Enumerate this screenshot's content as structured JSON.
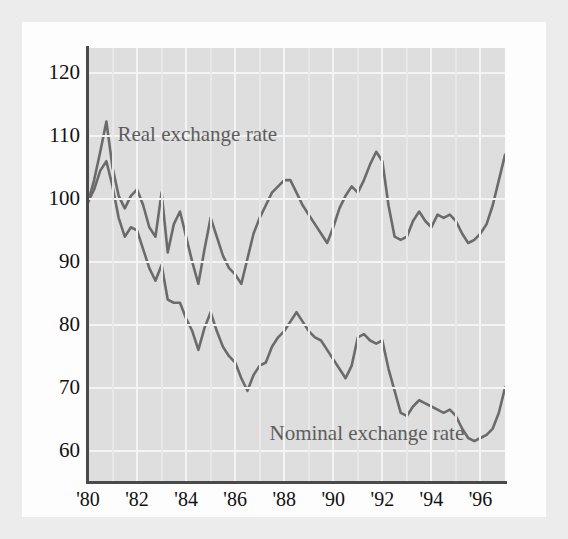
{
  "figure": {
    "background": "#fdfdfd",
    "plot_background": "#dedede",
    "axis_color": "#4a4a4a",
    "gridline_color": "#f4f4f4",
    "line_color": "#6b6b6b"
  },
  "chart_data": {
    "type": "line",
    "title": "",
    "subtitle": "",
    "xlabel": "",
    "ylabel": "",
    "xlim": [
      1980,
      1997
    ],
    "ylim": [
      55,
      124
    ],
    "grid": true,
    "legend_position": "inline-annotations",
    "ytick_labels": [
      "120",
      "110",
      "100",
      "90",
      "80",
      "70",
      "60"
    ],
    "ytick_values": [
      120,
      110,
      100,
      90,
      80,
      70,
      60
    ],
    "xtick_labels": [
      "'80",
      "'82",
      "'84",
      "'86",
      "'88",
      "'90",
      "'92",
      "'94",
      "'96"
    ],
    "xtick_values": [
      1980,
      1982,
      1984,
      1986,
      1988,
      1990,
      1992,
      1994,
      1996
    ],
    "annotations": [
      {
        "text": "Real exchange rate",
        "x": 1981.2,
        "y": 110
      },
      {
        "text": "Nominal exchange rate",
        "x": 1987.4,
        "y": 62.5
      }
    ],
    "x": [
      1980.0,
      1980.25,
      1980.5,
      1980.75,
      1981.0,
      1981.25,
      1981.5,
      1981.75,
      1982.0,
      1982.25,
      1982.5,
      1982.75,
      1983.0,
      1983.25,
      1983.5,
      1983.75,
      1984.0,
      1984.25,
      1984.5,
      1984.75,
      1985.0,
      1985.25,
      1985.5,
      1985.75,
      1986.0,
      1986.25,
      1986.5,
      1986.75,
      1987.0,
      1987.25,
      1987.5,
      1987.75,
      1988.0,
      1988.25,
      1988.5,
      1988.75,
      1989.0,
      1989.25,
      1989.5,
      1989.75,
      1990.0,
      1990.25,
      1990.5,
      1990.75,
      1991.0,
      1991.25,
      1991.5,
      1991.75,
      1992.0,
      1992.25,
      1992.5,
      1992.75,
      1993.0,
      1993.25,
      1993.5,
      1993.75,
      1994.0,
      1994.25,
      1994.5,
      1994.75,
      1995.0,
      1995.25,
      1995.5,
      1995.75,
      1996.0,
      1996.25,
      1996.5,
      1996.75,
      1997.0
    ],
    "series": [
      {
        "name": "Real exchange rate",
        "color": "#6b6b6b",
        "values": [
          99.5,
          103.0,
          107.5,
          112.3,
          105.0,
          100.5,
          98.5,
          100.5,
          101.5,
          99.0,
          95.5,
          94.0,
          101.0,
          91.5,
          96.0,
          98.0,
          94.0,
          90.0,
          86.5,
          92.0,
          97.0,
          94.0,
          91.0,
          89.0,
          88.0,
          86.5,
          90.5,
          94.5,
          97.0,
          99.0,
          101.0,
          102.0,
          103.0,
          103.0,
          101.0,
          99.0,
          97.5,
          96.0,
          94.5,
          93.0,
          95.5,
          98.5,
          100.5,
          102.0,
          101.0,
          103.0,
          105.5,
          107.5,
          106.0,
          99.0,
          94.0,
          93.5,
          94.0,
          96.5,
          98.0,
          96.5,
          95.5,
          97.5,
          97.0,
          97.5,
          96.5,
          94.5,
          93.0,
          93.5,
          94.5,
          96.0,
          99.0,
          103.0,
          107.0
        ]
      },
      {
        "name": "Nominal exchange rate",
        "color": "#6b6b6b",
        "values": [
          99.5,
          101.5,
          104.5,
          106.0,
          102.0,
          97.0,
          94.0,
          95.5,
          95.0,
          92.0,
          89.0,
          87.0,
          89.5,
          84.0,
          83.5,
          83.5,
          81.0,
          79.0,
          76.0,
          79.5,
          82.0,
          79.0,
          76.5,
          75.0,
          74.0,
          71.5,
          69.5,
          72.0,
          73.5,
          74.0,
          76.5,
          78.0,
          79.0,
          80.5,
          82.0,
          80.5,
          79.0,
          78.0,
          77.5,
          76.0,
          74.5,
          73.0,
          71.5,
          73.5,
          78.0,
          78.5,
          77.5,
          77.0,
          77.5,
          73.0,
          69.5,
          66.0,
          65.5,
          67.0,
          68.0,
          67.5,
          67.0,
          66.5,
          66.0,
          66.5,
          65.5,
          63.5,
          62.0,
          61.5,
          62.0,
          62.5,
          63.5,
          66.0,
          70.0
        ]
      }
    ]
  }
}
